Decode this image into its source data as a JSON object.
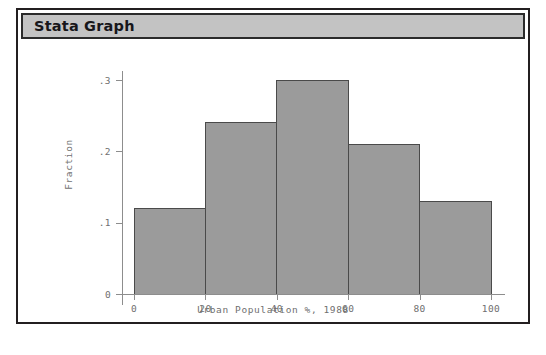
{
  "window": {
    "title": "Stata Graph"
  },
  "chart_data": {
    "type": "bar",
    "title": "",
    "xlabel": "Urban Population %, 1988",
    "ylabel": "Fraction",
    "categories": [
      "0-20",
      "20-40",
      "40-60",
      "60-80",
      "80-100"
    ],
    "bin_edges": [
      0,
      20,
      40,
      60,
      80,
      100
    ],
    "values": [
      0.12,
      0.24,
      0.3,
      0.21,
      0.13
    ],
    "xlim": [
      0,
      100
    ],
    "ylim": [
      0,
      0.3
    ],
    "xticks": [
      "0",
      "20",
      "40",
      "60",
      "80",
      "100"
    ],
    "xtick_values": [
      0,
      20,
      40,
      60,
      80,
      100
    ],
    "yticks": [
      "0",
      ".1",
      ".2",
      ".3"
    ],
    "ytick_values": [
      0,
      0.1,
      0.2,
      0.3
    ],
    "grid": false,
    "legend": "none",
    "bar_color": "#9b9b9b",
    "bar_edge_color": "#4a4a4a",
    "axis_color": "#8d8d8d",
    "text_color": "#6f6f6f"
  }
}
